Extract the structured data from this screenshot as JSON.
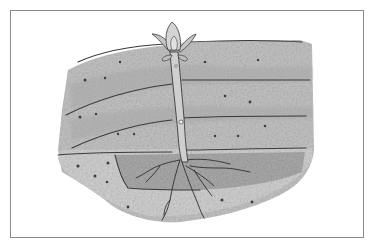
{
  "image": {
    "subject": "Seedling growing through layered soil with roots",
    "style": "grayscale watercolor illustration",
    "colors": {
      "background": "#ffffff",
      "frame_border": "#8a8a8a",
      "soil_light": "#cfcfcf",
      "soil_mid": "#b3b3b3",
      "soil_dark": "#9a9a9a",
      "line_dark": "#3a3a3a",
      "plant_stem": "#c8c8c8",
      "leaf": "#bdbdbd"
    },
    "layers": 4,
    "elements": [
      "frame",
      "soil-mound",
      "soil-layer-lines",
      "root-pocket",
      "seedling-stem",
      "seedling-leaves",
      "roots",
      "pebbles"
    ]
  }
}
